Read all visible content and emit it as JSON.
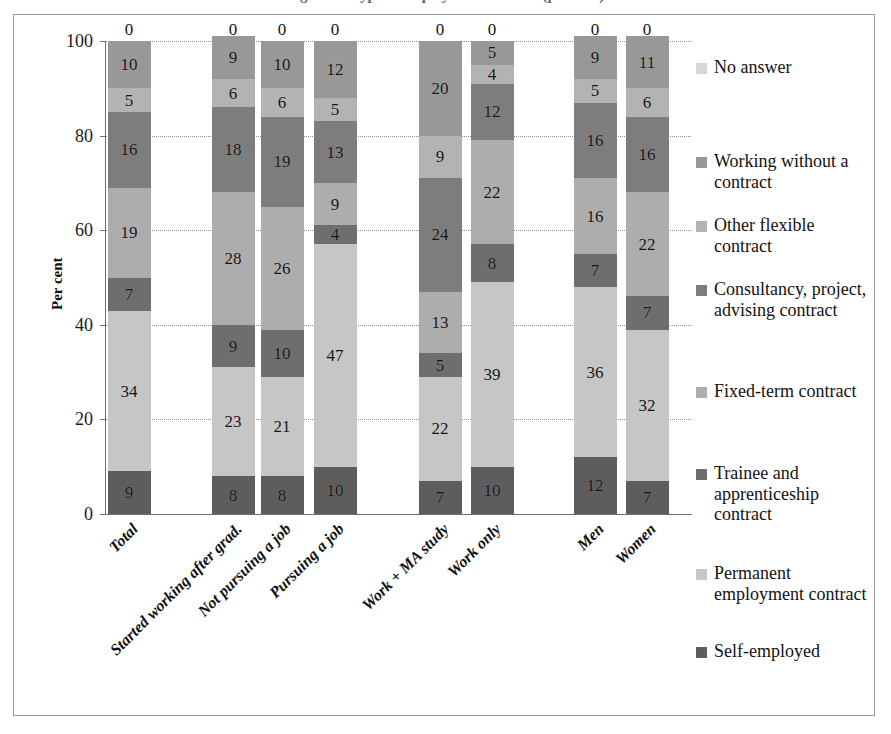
{
  "title": {
    "cropped_text": "Figure — Type of employment contract (per cent)"
  },
  "axes": {
    "ylabel": "Per cent",
    "yticks": [
      "0",
      "20",
      "40",
      "60",
      "80",
      "100"
    ],
    "ymin": 0,
    "ymax": 100
  },
  "legend": {
    "items": [
      {
        "label": "No answer",
        "color": "#d8d8d8"
      },
      {
        "label": "Working without a contract",
        "color": "#989898"
      },
      {
        "label": "Other flexible contract",
        "color": "#b3b3b3"
      },
      {
        "label": "Consultancy, project, advising contract",
        "color": "#7d7d7d"
      },
      {
        "label": "Fixed-term contract",
        "color": "#adadad"
      },
      {
        "label": "Trainee and apprenticeship contract",
        "color": "#6e6e6e"
      },
      {
        "label": "Permanent employment contract",
        "color": "#c6c6c6"
      },
      {
        "label": "Self-employed",
        "color": "#5d5d5d"
      }
    ]
  },
  "chart_data": {
    "type": "bar",
    "stacked": true,
    "title": "Type of employment contract (per cent)",
    "xlabel": "",
    "ylabel": "Per cent",
    "ylim": [
      0,
      100
    ],
    "grid": true,
    "legend_position": "right",
    "categories": [
      "Total",
      "Started working after grad.",
      "Not pursuing a job",
      "Pursuing a job",
      "Work + MA study",
      "Work only",
      "Men",
      "Women"
    ],
    "category_x_centers": [
      128,
      232,
      281,
      334,
      439,
      491,
      594,
      646
    ],
    "series": [
      {
        "name": "Self-employed",
        "color": "#5d5d5d",
        "values": [
          9,
          8,
          8,
          10,
          7,
          10,
          12,
          7
        ]
      },
      {
        "name": "Permanent employment contract",
        "color": "#c6c6c6",
        "values": [
          34,
          23,
          21,
          47,
          22,
          39,
          36,
          32
        ]
      },
      {
        "name": "Trainee and apprenticeship contract",
        "color": "#6e6e6e",
        "values": [
          7,
          9,
          10,
          4,
          5,
          8,
          7,
          7
        ]
      },
      {
        "name": "Fixed-term contract",
        "color": "#adadad",
        "values": [
          19,
          28,
          26,
          9,
          13,
          22,
          16,
          22
        ]
      },
      {
        "name": "Consultancy, project, advising contract",
        "color": "#7d7d7d",
        "values": [
          16,
          18,
          19,
          13,
          24,
          12,
          16,
          16
        ]
      },
      {
        "name": "Other flexible contract",
        "color": "#b3b3b3",
        "values": [
          5,
          6,
          6,
          5,
          9,
          4,
          5,
          6
        ]
      },
      {
        "name": "Working without a contract",
        "color": "#989898",
        "values": [
          10,
          9,
          10,
          12,
          20,
          5,
          9,
          11
        ]
      },
      {
        "name": "No answer",
        "color": "#d8d8d8",
        "values": [
          0,
          0,
          0,
          0,
          0,
          0,
          0,
          0
        ]
      }
    ]
  }
}
